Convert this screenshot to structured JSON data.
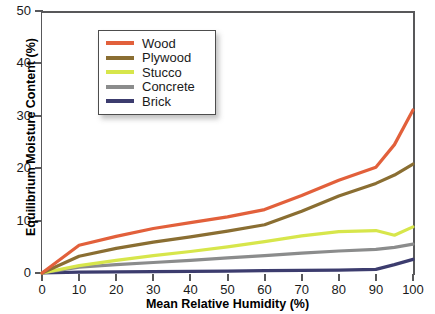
{
  "chart_data": {
    "type": "line",
    "title": "",
    "xlabel": "Mean Relative Humidity (%)",
    "ylabel": "Equilibrium Moisture Content (%)",
    "xlim": [
      0,
      100
    ],
    "ylim": [
      0,
      50
    ],
    "xticks": [
      "0",
      "10",
      "20",
      "30",
      "40",
      "50",
      "60",
      "70",
      "80",
      "90",
      "100"
    ],
    "yticks": [
      "0",
      "10",
      "20",
      "30",
      "40",
      "50"
    ],
    "grid": false,
    "legend_position": "upper-left-inside",
    "x": [
      0,
      10,
      20,
      30,
      40,
      50,
      60,
      70,
      80,
      90,
      95,
      100
    ],
    "series": [
      {
        "name": "Wood",
        "color": "#E2603B",
        "values": [
          0.0,
          5.3,
          7.0,
          8.5,
          9.6,
          10.7,
          12.1,
          14.8,
          17.7,
          20.2,
          24.5,
          31.1
        ]
      },
      {
        "name": "Plywood",
        "color": "#8A6E32",
        "values": [
          0.0,
          3.2,
          4.7,
          5.9,
          6.9,
          8.0,
          9.2,
          11.8,
          14.7,
          17.1,
          18.7,
          20.8
        ]
      },
      {
        "name": "Stucco",
        "color": "#D7E64B",
        "values": [
          0.0,
          1.4,
          2.4,
          3.3,
          4.1,
          5.0,
          6.0,
          7.1,
          7.9,
          8.1,
          7.2,
          8.8
        ]
      },
      {
        "name": "Concrete",
        "color": "#8B8C8C",
        "values": [
          0.0,
          1.1,
          1.6,
          2.0,
          2.4,
          2.9,
          3.3,
          3.8,
          4.2,
          4.5,
          4.9,
          5.5
        ]
      },
      {
        "name": "Brick",
        "color": "#3C3C6E",
        "values": [
          0.0,
          0.15,
          0.2,
          0.25,
          0.3,
          0.35,
          0.45,
          0.5,
          0.55,
          0.7,
          1.6,
          2.6
        ]
      }
    ]
  },
  "axes": {
    "y_title": "Equilibrium Moisture Content (%)",
    "x_title": "Mean Relative Humidity (%)"
  },
  "legend": {
    "items": [
      {
        "label": "Wood",
        "color": "#E2603B"
      },
      {
        "label": "Plywood",
        "color": "#8A6E32"
      },
      {
        "label": "Stucco",
        "color": "#D7E64B"
      },
      {
        "label": "Concrete",
        "color": "#8B8C8C"
      },
      {
        "label": "Brick",
        "color": "#3C3C6E"
      }
    ]
  }
}
